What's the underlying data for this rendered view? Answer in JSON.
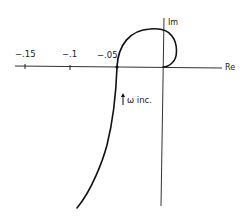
{
  "diagram": {
    "type": "nyquist-plot",
    "axes": {
      "real_label": "Re",
      "imag_label": "Im"
    },
    "ticks": [
      {
        "label": "−.15",
        "value": -0.15
      },
      {
        "label": "−.1",
        "value": -0.1
      },
      {
        "label": "−.05",
        "value": -0.05
      }
    ],
    "annotation": {
      "arrow": "up-arrow",
      "text": "ω inc."
    },
    "colors": {
      "curve": "#111111",
      "axis": "#333333",
      "background": "#ffffff"
    }
  }
}
